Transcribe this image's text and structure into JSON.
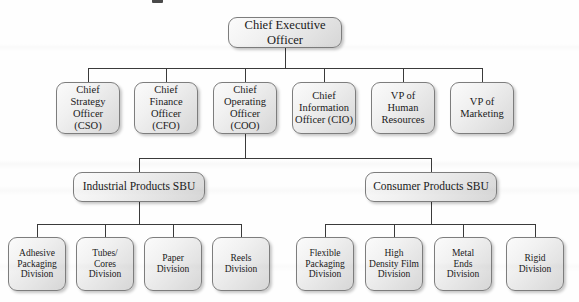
{
  "chart_data": {
    "type": "org-chart",
    "levels": [
      "executive",
      "officers",
      "strategic-business-units",
      "divisions"
    ]
  },
  "artifacts": {
    "top_smudge": "scan-artifact"
  },
  "nodes": {
    "ceo": {
      "label": "Chief Executive Officer",
      "x": 228,
      "y": 17,
      "w": 114,
      "h": 31
    },
    "executives": [
      {
        "label": "Chief\nStrategy\nOfficer (CSO)",
        "x": 56,
        "y": 82,
        "w": 64,
        "h": 52
      },
      {
        "label": "Chief\nFinance\nOfficer (CFO)",
        "x": 134,
        "y": 82,
        "w": 64,
        "h": 52
      },
      {
        "label": "Chief\nOperating\nOfficer (COO)",
        "x": 213,
        "y": 82,
        "w": 64,
        "h": 52
      },
      {
        "label": "Chief\nInformation\nOfficer (CIO)",
        "x": 292,
        "y": 82,
        "w": 64,
        "h": 52
      },
      {
        "label": "VP of\nHuman\nResources",
        "x": 371,
        "y": 82,
        "w": 64,
        "h": 52
      },
      {
        "label": "VP of\nMarketing",
        "x": 450,
        "y": 82,
        "w": 64,
        "h": 52
      }
    ],
    "sbus": [
      {
        "label": "Industrial Products SBU",
        "x": 73,
        "y": 172,
        "w": 132,
        "h": 30
      },
      {
        "label": "Consumer Products SBU",
        "x": 365,
        "y": 172,
        "w": 132,
        "h": 30
      }
    ],
    "divisions": [
      {
        "label": "Adhesive\nPackaging\nDivision",
        "x": 8,
        "y": 237,
        "w": 58,
        "h": 54
      },
      {
        "label": "Tubes/\nCores\nDivision",
        "x": 76,
        "y": 237,
        "w": 58,
        "h": 54
      },
      {
        "label": "Paper\nDivision",
        "x": 144,
        "y": 237,
        "w": 58,
        "h": 54
      },
      {
        "label": "Reels\nDivision",
        "x": 212,
        "y": 237,
        "w": 58,
        "h": 54
      },
      {
        "label": "Flexible\nPackaging\nDivision",
        "x": 296,
        "y": 237,
        "w": 58,
        "h": 54
      },
      {
        "label": "High\nDensity Film\nDivision",
        "x": 365,
        "y": 237,
        "w": 58,
        "h": 54
      },
      {
        "label": "Metal\nEnds\nDivision",
        "x": 434,
        "y": 237,
        "w": 58,
        "h": 54
      },
      {
        "label": "Rigid\nDivision",
        "x": 506,
        "y": 237,
        "w": 58,
        "h": 54
      }
    ]
  },
  "connectors": [
    {
      "name": "ceo-stem",
      "type": "v",
      "x": 285,
      "y": 48,
      "len": 20
    },
    {
      "name": "exec-bus",
      "type": "h",
      "x": 88,
      "y": 68,
      "len": 394
    },
    {
      "name": "exec-drop-cso",
      "type": "v",
      "x": 88,
      "y": 68,
      "len": 14
    },
    {
      "name": "exec-drop-cfo",
      "type": "v",
      "x": 166,
      "y": 68,
      "len": 14
    },
    {
      "name": "exec-drop-coo",
      "type": "v",
      "x": 245,
      "y": 68,
      "len": 14
    },
    {
      "name": "exec-drop-cio",
      "type": "v",
      "x": 324,
      "y": 68,
      "len": 14
    },
    {
      "name": "exec-drop-hr",
      "type": "v",
      "x": 403,
      "y": 68,
      "len": 14
    },
    {
      "name": "exec-drop-mkt",
      "type": "v",
      "x": 482,
      "y": 68,
      "len": 14
    },
    {
      "name": "coo-stem",
      "type": "v",
      "x": 245,
      "y": 134,
      "len": 24
    },
    {
      "name": "sbu-bus",
      "type": "h",
      "x": 139,
      "y": 158,
      "len": 293
    },
    {
      "name": "sbu-drop-industrial",
      "type": "v",
      "x": 139,
      "y": 158,
      "len": 14
    },
    {
      "name": "sbu-drop-consumer",
      "type": "v",
      "x": 431,
      "y": 158,
      "len": 14
    },
    {
      "name": "industrial-stem",
      "type": "v",
      "x": 139,
      "y": 202,
      "len": 22
    },
    {
      "name": "industrial-bus",
      "type": "h",
      "x": 37,
      "y": 224,
      "len": 204
    },
    {
      "name": "div-drop-adhesive",
      "type": "v",
      "x": 37,
      "y": 224,
      "len": 13
    },
    {
      "name": "div-drop-tubes",
      "type": "v",
      "x": 105,
      "y": 224,
      "len": 13
    },
    {
      "name": "div-drop-paper",
      "type": "v",
      "x": 173,
      "y": 224,
      "len": 13
    },
    {
      "name": "div-drop-reels",
      "type": "v",
      "x": 241,
      "y": 224,
      "len": 13
    },
    {
      "name": "consumer-stem",
      "type": "v",
      "x": 431,
      "y": 202,
      "len": 22
    },
    {
      "name": "consumer-bus",
      "type": "h",
      "x": 325,
      "y": 224,
      "len": 210
    },
    {
      "name": "div-drop-flexible",
      "type": "v",
      "x": 325,
      "y": 224,
      "len": 13
    },
    {
      "name": "div-drop-hdfilm",
      "type": "v",
      "x": 394,
      "y": 224,
      "len": 13
    },
    {
      "name": "div-drop-metalends",
      "type": "v",
      "x": 463,
      "y": 224,
      "len": 13
    },
    {
      "name": "div-drop-rigid",
      "type": "v",
      "x": 535,
      "y": 224,
      "len": 13
    }
  ]
}
